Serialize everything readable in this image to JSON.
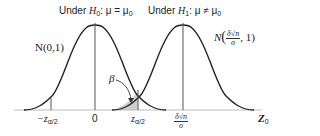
{
  "diagram": {
    "title_h0": {
      "prefix": "Under ",
      "hyp": "H",
      "hyp_sub": "0",
      "rel": ": μ = μ",
      "rel_sub": "0"
    },
    "title_h1": {
      "prefix": "Under ",
      "hyp": "H",
      "hyp_sub": "1",
      "rel": ": μ ≠ μ",
      "rel_sub": "0"
    },
    "dist_h0": "N(0,1)",
    "dist_h1": {
      "prefix": "N",
      "lparen": "(",
      "num": "δ√n",
      "den": "σ",
      "suffix": ", 1)"
    },
    "beta_label": "β",
    "axis": {
      "ticks": [
        {
          "id": "neg_z",
          "text": "−z",
          "sub": "α/2"
        },
        {
          "id": "zero",
          "text": "0"
        },
        {
          "id": "pos_z",
          "text": "z",
          "sub": "α/2"
        },
        {
          "id": "shift",
          "num": "δ√n",
          "den": "σ"
        }
      ],
      "label": "Z",
      "label_sub": "0"
    },
    "colors": {
      "curve": "#222222",
      "axis": "#bbbbbb",
      "vline": "#555555",
      "shade": "#cfcfcf"
    }
  }
}
